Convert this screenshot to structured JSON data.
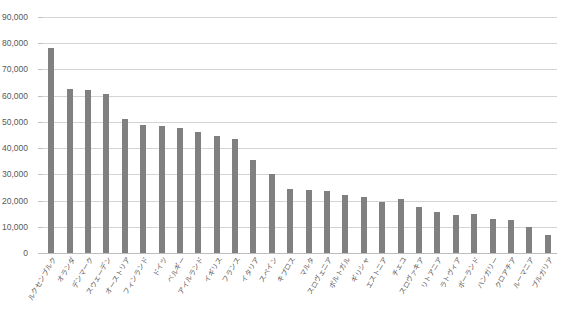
{
  "chart_data": {
    "type": "bar",
    "title": "",
    "xlabel": "",
    "ylabel": "",
    "ylim": [
      0,
      90000
    ],
    "ytick_values": [
      0,
      10000,
      20000,
      30000,
      40000,
      50000,
      60000,
      70000,
      80000,
      90000
    ],
    "ytick_labels": [
      "0",
      "10,000",
      "20,000",
      "30,000",
      "40,000",
      "50,000",
      "60,000",
      "70,000",
      "80,000",
      "90,000"
    ],
    "grid": true,
    "legend": false,
    "bar_color": "#808080",
    "grid_color": "#d4d4d4",
    "axis_color": "#bdbdbd",
    "tick_label_color": "#595959",
    "categories": [
      "ルクセンブルク",
      "オランダ",
      "デンマーク",
      "スウェーデン",
      "オーストリア",
      "フィンランド",
      "ドイツ",
      "ベルギー",
      "アイルランド",
      "イギリス",
      "フランス",
      "イタリア",
      "スペイン",
      "キプロス",
      "マルタ",
      "スロヴェニア",
      "ポルトガル",
      "ギリシャ",
      "エストニア",
      "チェコ",
      "スロヴァキア",
      "リトアニア",
      "ラトヴィア",
      "ポーランド",
      "ハンガリー",
      "クロアチア",
      "ルーマニア",
      "ブルガリア"
    ],
    "values": [
      78000,
      62500,
      62000,
      60500,
      51000,
      49000,
      48500,
      47500,
      46000,
      44500,
      43500,
      35500,
      30000,
      24500,
      24000,
      23500,
      22000,
      21500,
      19500,
      20500,
      17500,
      15500,
      14500,
      15000,
      13000,
      12500,
      10000,
      7000
    ]
  }
}
